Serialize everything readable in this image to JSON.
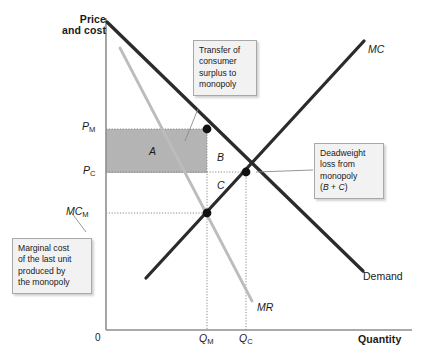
{
  "figure": {
    "type": "economics-diagram",
    "title_axes": {
      "y_axis_label": "Price and cost",
      "x_axis_label": "Quantity",
      "origin_label": "0"
    },
    "axis_ticks": {
      "y": [
        {
          "name": "P_M",
          "base": "P",
          "sub": "M",
          "y_px": 127
        },
        {
          "name": "P_C",
          "base": "P",
          "sub": "C",
          "y_px": 171
        },
        {
          "name": "MC_M",
          "base": "MC",
          "sub": "M",
          "y_px": 212
        }
      ],
      "x": [
        {
          "name": "Q_M",
          "base": "Q",
          "sub": "M",
          "x_px": 205
        },
        {
          "name": "Q_C",
          "base": "Q",
          "sub": "C",
          "x_px": 245
        }
      ]
    },
    "curves": [
      {
        "id": "demand",
        "label": "Demand",
        "italic": false,
        "color": "#2b2b2b",
        "width": 3.2
      },
      {
        "id": "marginal-cost",
        "label": "MC",
        "italic": true,
        "color": "#2b2b2b",
        "width": 3.2
      },
      {
        "id": "marginal-revenue",
        "label": "MR",
        "italic": true,
        "color": "#b8b8b8",
        "width": 2.6
      }
    ],
    "regions": [
      {
        "id": "region-a",
        "label": "A",
        "meaning": "transfer of consumer surplus to monopoly",
        "shaded": true
      },
      {
        "id": "region-b",
        "label": "B",
        "meaning": "deadweight loss upper triangle",
        "shaded": false
      },
      {
        "id": "region-c",
        "label": "C",
        "meaning": "deadweight loss lower triangle",
        "shaded": false
      }
    ],
    "callouts": [
      {
        "id": "transfer-callout",
        "lines": [
          "Transfer of",
          "consumer",
          "surplus to",
          "monopoly"
        ]
      },
      {
        "id": "deadweight-callout",
        "lines": [
          "Deadweight",
          "loss from",
          "monopoly",
          "(B + C)"
        ],
        "italic_tokens": [
          "B",
          "C"
        ]
      },
      {
        "id": "marginal-cost-callout",
        "lines": [
          "Marginal cost",
          "of the last unit",
          "produced by",
          "the monopoly"
        ]
      }
    ],
    "points": [
      {
        "id": "monopoly-point",
        "x_px": 207,
        "y_px": 129
      },
      {
        "id": "competitive-point",
        "x_px": 246,
        "y_px": 172
      },
      {
        "id": "mc-at-qm-point",
        "x_px": 207,
        "y_px": 213
      }
    ],
    "colors": {
      "shaded_region": "#b4b4b4",
      "curve_dark": "#2b2b2b",
      "curve_light": "#b8b8b8",
      "axis": "#8e8e8e",
      "guide": "#9a9a9a",
      "callout_bg": "#f2f2f2",
      "callout_border": "#a8a8a8"
    }
  }
}
